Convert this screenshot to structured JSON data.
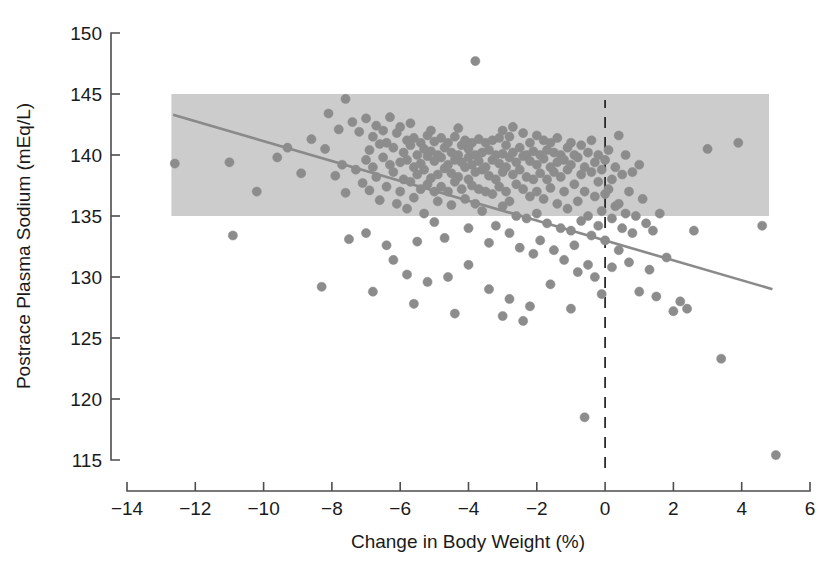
{
  "chart_data": {
    "type": "scatter",
    "title": "",
    "xlabel": "Change in Body Weight (%)",
    "ylabel": "Postrace Plasma Sodium (mEq/L)",
    "xlim": [
      -14,
      6
    ],
    "ylim": [
      115,
      150
    ],
    "xticks": [
      -14,
      -12,
      -10,
      -8,
      -6,
      -4,
      -2,
      0,
      2,
      4,
      6
    ],
    "xtick_labels": [
      "−14",
      "−12",
      "−10",
      "−8",
      "−6",
      "−4",
      "−2",
      "0",
      "2",
      "4",
      "6"
    ],
    "yticks": [
      115,
      120,
      125,
      130,
      135,
      140,
      145,
      150
    ],
    "ytick_labels": [
      "115",
      "120",
      "125",
      "130",
      "135",
      "140",
      "145",
      "150"
    ],
    "grid": false,
    "legend": null,
    "point_color": "#8c8c8c",
    "point_radius_px": 4.6,
    "annotations": {
      "reference_band": {
        "label": "normal plasma sodium reference range",
        "y_low": 135,
        "y_high": 145,
        "x_start": -12.7,
        "x_end": 4.8,
        "color": "#cccccc"
      },
      "zero_weight_change_line": {
        "label": "zero change in body weight",
        "x": 0,
        "style": "dashed",
        "color": "#2b2b2b"
      },
      "regression_line": {
        "label": "linear regression fit",
        "x1": -12.65,
        "y1": 143.3,
        "x2": 4.9,
        "y2": 129.0,
        "color": "#8a8a8a"
      }
    },
    "points": [
      [
        -12.6,
        139.3
      ],
      [
        -11.0,
        139.4
      ],
      [
        -10.9,
        133.4
      ],
      [
        -9.3,
        140.6
      ],
      [
        -8.6,
        141.3
      ],
      [
        -8.3,
        129.2
      ],
      [
        -8.2,
        140.5
      ],
      [
        -8.1,
        143.4
      ],
      [
        -7.9,
        138.3
      ],
      [
        -7.8,
        142.1
      ],
      [
        -7.7,
        139.2
      ],
      [
        -7.6,
        144.6
      ],
      [
        -7.6,
        136.9
      ],
      [
        -7.5,
        133.1
      ],
      [
        -7.4,
        142.7
      ],
      [
        -7.3,
        138.8
      ],
      [
        -7.2,
        141.9
      ],
      [
        -7.1,
        137.7
      ],
      [
        -7.0,
        143.0
      ],
      [
        -7.0,
        139.6
      ],
      [
        -6.9,
        140.4
      ],
      [
        -6.9,
        137.1
      ],
      [
        -6.8,
        141.5
      ],
      [
        -6.8,
        139.0
      ],
      [
        -6.7,
        142.4
      ],
      [
        -6.7,
        138.2
      ],
      [
        -6.6,
        140.9
      ],
      [
        -6.6,
        136.3
      ],
      [
        -6.5,
        139.8
      ],
      [
        -6.5,
        142.0
      ],
      [
        -6.4,
        137.4
      ],
      [
        -6.4,
        141.0
      ],
      [
        -6.3,
        139.2
      ],
      [
        -6.3,
        143.1
      ],
      [
        -6.2,
        138.6
      ],
      [
        -6.2,
        140.6
      ],
      [
        -6.1,
        136.0
      ],
      [
        -6.1,
        141.8
      ],
      [
        -6.0,
        139.4
      ],
      [
        -6.0,
        142.3
      ],
      [
        -6.0,
        137.0
      ],
      [
        -5.9,
        140.2
      ],
      [
        -5.9,
        138.0
      ],
      [
        -5.8,
        141.2
      ],
      [
        -5.8,
        139.6
      ],
      [
        -5.8,
        135.6
      ],
      [
        -5.7,
        140.8
      ],
      [
        -5.7,
        137.8
      ],
      [
        -5.7,
        142.6
      ],
      [
        -5.6,
        139.0
      ],
      [
        -5.6,
        141.4
      ],
      [
        -5.6,
        136.5
      ],
      [
        -5.5,
        140.0
      ],
      [
        -5.5,
        138.4
      ],
      [
        -5.5,
        132.9
      ],
      [
        -5.4,
        141.0
      ],
      [
        -5.4,
        139.3
      ],
      [
        -5.4,
        137.2
      ],
      [
        -5.3,
        140.5
      ],
      [
        -5.3,
        138.8
      ],
      [
        -5.3,
        135.2
      ],
      [
        -5.2,
        141.6
      ],
      [
        -5.2,
        139.9
      ],
      [
        -5.2,
        137.6
      ],
      [
        -5.1,
        140.3
      ],
      [
        -5.1,
        138.1
      ],
      [
        -5.1,
        142.0
      ],
      [
        -5.0,
        139.5
      ],
      [
        -5.0,
        137.0
      ],
      [
        -5.0,
        141.1
      ],
      [
        -5.0,
        134.5
      ],
      [
        -4.9,
        140.0
      ],
      [
        -4.9,
        138.4
      ],
      [
        -4.9,
        136.2
      ],
      [
        -4.8,
        139.8
      ],
      [
        -4.8,
        141.4
      ],
      [
        -4.8,
        137.4
      ],
      [
        -4.7,
        140.6
      ],
      [
        -4.7,
        138.9
      ],
      [
        -4.7,
        133.2
      ],
      [
        -4.6,
        139.2
      ],
      [
        -4.6,
        141.0
      ],
      [
        -4.6,
        137.0
      ],
      [
        -4.5,
        140.2
      ],
      [
        -4.5,
        138.5
      ],
      [
        -4.5,
        135.9
      ],
      [
        -4.4,
        139.6
      ],
      [
        -4.4,
        141.5
      ],
      [
        -4.4,
        137.8
      ],
      [
        -4.3,
        140.0
      ],
      [
        -4.3,
        138.2
      ],
      [
        -4.3,
        142.2
      ],
      [
        -4.2,
        139.4
      ],
      [
        -4.2,
        137.2
      ],
      [
        -4.2,
        140.8
      ],
      [
        -4.1,
        139.0
      ],
      [
        -4.1,
        141.2
      ],
      [
        -4.1,
        136.4
      ],
      [
        -4.0,
        139.8
      ],
      [
        -4.0,
        138.0
      ],
      [
        -4.0,
        140.5
      ],
      [
        -4.0,
        134.0
      ],
      [
        -3.9,
        139.2
      ],
      [
        -3.9,
        141.0
      ],
      [
        -3.9,
        137.5
      ],
      [
        -3.8,
        147.7
      ],
      [
        -3.8,
        140.0
      ],
      [
        -3.8,
        138.6
      ],
      [
        -3.8,
        136.0
      ],
      [
        -3.7,
        139.5
      ],
      [
        -3.7,
        141.3
      ],
      [
        -3.7,
        137.2
      ],
      [
        -3.6,
        140.2
      ],
      [
        -3.6,
        138.8
      ],
      [
        -3.6,
        135.4
      ],
      [
        -3.5,
        139.0
      ],
      [
        -3.5,
        141.0
      ],
      [
        -3.5,
        137.0
      ],
      [
        -3.4,
        140.4
      ],
      [
        -3.4,
        138.3
      ],
      [
        -3.4,
        132.8
      ],
      [
        -3.3,
        139.6
      ],
      [
        -3.3,
        141.2
      ],
      [
        -3.3,
        136.8
      ],
      [
        -3.2,
        140.0
      ],
      [
        -3.2,
        138.0
      ],
      [
        -3.2,
        134.2
      ],
      [
        -3.1,
        139.3
      ],
      [
        -3.1,
        141.4
      ],
      [
        -3.1,
        137.4
      ],
      [
        -3.0,
        140.1
      ],
      [
        -3.0,
        138.6
      ],
      [
        -3.0,
        135.8
      ],
      [
        -3.0,
        142.0
      ],
      [
        -2.9,
        139.0
      ],
      [
        -2.9,
        140.8
      ],
      [
        -2.9,
        137.0
      ],
      [
        -2.8,
        139.8
      ],
      [
        -2.8,
        141.5
      ],
      [
        -2.8,
        136.2
      ],
      [
        -2.8,
        133.6
      ],
      [
        -2.7,
        140.2
      ],
      [
        -2.7,
        138.4
      ],
      [
        -2.7,
        142.3
      ],
      [
        -2.6,
        139.4
      ],
      [
        -2.6,
        137.6
      ],
      [
        -2.6,
        135.0
      ],
      [
        -2.5,
        140.6
      ],
      [
        -2.5,
        138.8
      ],
      [
        -2.5,
        132.4
      ],
      [
        -2.4,
        139.9
      ],
      [
        -2.4,
        141.8
      ],
      [
        -2.4,
        137.2
      ],
      [
        -2.3,
        140.0
      ],
      [
        -2.3,
        138.2
      ],
      [
        -2.3,
        134.8
      ],
      [
        -2.2,
        139.5
      ],
      [
        -2.2,
        141.0
      ],
      [
        -2.2,
        136.6
      ],
      [
        -2.1,
        140.3
      ],
      [
        -2.1,
        138.0
      ],
      [
        -2.1,
        131.9
      ],
      [
        -2.0,
        139.2
      ],
      [
        -2.0,
        141.6
      ],
      [
        -2.0,
        137.0
      ],
      [
        -2.0,
        135.2
      ],
      [
        -1.9,
        140.0
      ],
      [
        -1.9,
        138.5
      ],
      [
        -1.9,
        133.0
      ],
      [
        -1.8,
        139.7
      ],
      [
        -1.8,
        141.2
      ],
      [
        -1.8,
        136.4
      ],
      [
        -1.7,
        140.4
      ],
      [
        -1.7,
        138.0
      ],
      [
        -1.7,
        134.4
      ],
      [
        -1.6,
        139.0
      ],
      [
        -1.6,
        141.0
      ],
      [
        -1.6,
        137.3
      ],
      [
        -1.5,
        140.2
      ],
      [
        -1.5,
        138.6
      ],
      [
        -1.5,
        132.2
      ],
      [
        -1.4,
        139.4
      ],
      [
        -1.4,
        136.0
      ],
      [
        -1.4,
        141.4
      ],
      [
        -1.3,
        140.0
      ],
      [
        -1.3,
        138.2
      ],
      [
        -1.3,
        134.0
      ],
      [
        -1.2,
        139.6
      ],
      [
        -1.2,
        137.0
      ],
      [
        -1.2,
        131.4
      ],
      [
        -1.1,
        140.6
      ],
      [
        -1.1,
        138.8
      ],
      [
        -1.1,
        135.6
      ],
      [
        -1.0,
        139.2
      ],
      [
        -1.0,
        141.0
      ],
      [
        -1.0,
        133.8
      ],
      [
        -0.9,
        140.0
      ],
      [
        -0.9,
        137.6
      ],
      [
        -0.9,
        132.6
      ],
      [
        -0.8,
        139.8
      ],
      [
        -0.8,
        136.2
      ],
      [
        -0.8,
        130.4
      ],
      [
        -0.7,
        138.4
      ],
      [
        -0.7,
        140.8
      ],
      [
        -0.7,
        134.6
      ],
      [
        -0.6,
        139.0
      ],
      [
        -0.6,
        137.0
      ],
      [
        -0.6,
        118.5
      ],
      [
        -0.5,
        140.2
      ],
      [
        -0.5,
        135.0
      ],
      [
        -0.5,
        131.0
      ],
      [
        -0.4,
        138.6
      ],
      [
        -0.4,
        141.2
      ],
      [
        -0.4,
        133.4
      ],
      [
        -0.3,
        139.4
      ],
      [
        -0.3,
        136.6
      ],
      [
        -0.3,
        130.0
      ],
      [
        -0.2,
        140.0
      ],
      [
        -0.2,
        137.8
      ],
      [
        -0.2,
        134.2
      ],
      [
        -0.1,
        138.8
      ],
      [
        -0.1,
        135.4
      ],
      [
        -0.1,
        128.6
      ],
      [
        0.0,
        139.6
      ],
      [
        0.0,
        136.8
      ],
      [
        0.0,
        133.0
      ],
      [
        0.1,
        140.4
      ],
      [
        0.1,
        137.2
      ],
      [
        0.2,
        138.0
      ],
      [
        0.2,
        134.8
      ],
      [
        0.2,
        130.8
      ],
      [
        0.3,
        139.0
      ],
      [
        0.3,
        135.8
      ],
      [
        0.4,
        141.6
      ],
      [
        0.4,
        136.0
      ],
      [
        0.4,
        132.2
      ],
      [
        0.5,
        138.4
      ],
      [
        0.5,
        134.0
      ],
      [
        0.6,
        140.0
      ],
      [
        0.6,
        135.2
      ],
      [
        0.7,
        137.0
      ],
      [
        0.7,
        131.2
      ],
      [
        0.8,
        138.6
      ],
      [
        0.8,
        133.6
      ],
      [
        0.9,
        135.0
      ],
      [
        1.0,
        139.2
      ],
      [
        1.0,
        128.8
      ],
      [
        1.1,
        136.4
      ],
      [
        1.2,
        134.4
      ],
      [
        1.3,
        130.6
      ],
      [
        1.4,
        133.8
      ],
      [
        1.5,
        128.4
      ],
      [
        1.6,
        135.2
      ],
      [
        1.8,
        131.6
      ],
      [
        2.0,
        127.2
      ],
      [
        2.2,
        128.0
      ],
      [
        2.4,
        127.4
      ],
      [
        2.6,
        133.8
      ],
      [
        3.0,
        140.5
      ],
      [
        3.4,
        123.3
      ],
      [
        3.9,
        141.0
      ],
      [
        4.6,
        134.2
      ],
      [
        5.0,
        115.4
      ],
      [
        -8.9,
        138.5
      ],
      [
        -9.6,
        139.8
      ],
      [
        -10.2,
        137.0
      ],
      [
        -7.0,
        133.6
      ],
      [
        -6.4,
        132.6
      ],
      [
        -6.2,
        131.4
      ],
      [
        -5.8,
        130.2
      ],
      [
        -5.2,
        129.6
      ],
      [
        -4.6,
        130.0
      ],
      [
        -4.0,
        131.0
      ],
      [
        -3.4,
        129.0
      ],
      [
        -2.8,
        128.2
      ],
      [
        -2.2,
        127.6
      ],
      [
        -1.6,
        129.4
      ],
      [
        -1.0,
        127.4
      ],
      [
        -6.8,
        128.8
      ],
      [
        -4.4,
        127.0
      ],
      [
        -3.0,
        126.8
      ],
      [
        -5.6,
        127.8
      ],
      [
        -2.4,
        126.4
      ]
    ]
  }
}
